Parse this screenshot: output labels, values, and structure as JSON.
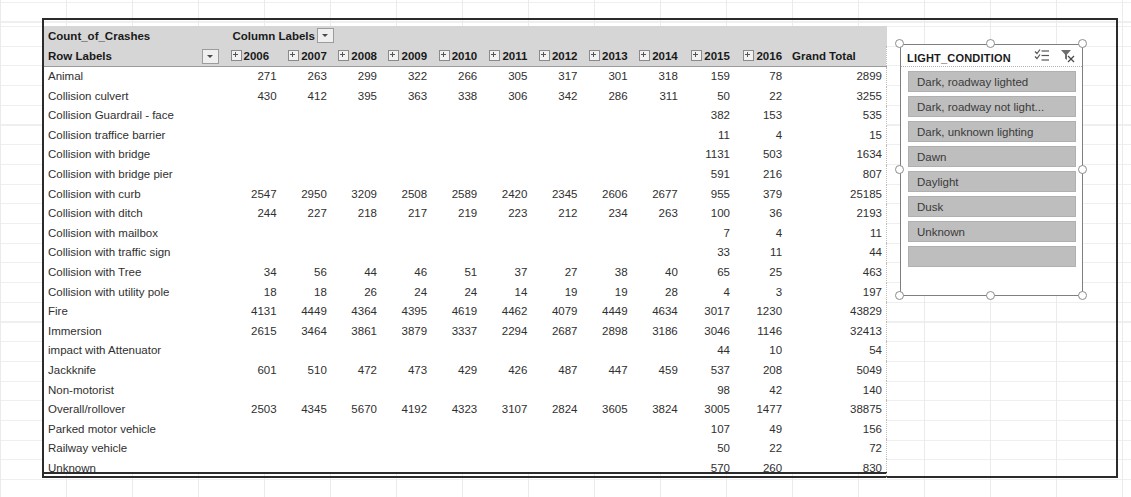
{
  "pivot": {
    "corner_label": "Count_of_Crashes",
    "column_labels_label": "Column Labels",
    "row_labels_label": "Row Labels",
    "grand_total_label": "Grand Total",
    "years": [
      "2006",
      "2007",
      "2008",
      "2009",
      "2010",
      "2011",
      "2012",
      "2013",
      "2014",
      "2015",
      "2016"
    ],
    "rows": [
      {
        "label": "Animal",
        "values": [
          "271",
          "263",
          "299",
          "322",
          "266",
          "305",
          "317",
          "301",
          "318",
          "159",
          "78"
        ],
        "total": "2899"
      },
      {
        "label": "Collision culvert",
        "values": [
          "430",
          "412",
          "395",
          "363",
          "338",
          "306",
          "342",
          "286",
          "311",
          "50",
          "22"
        ],
        "total": "3255"
      },
      {
        "label": "Collision Guardrail - face",
        "values": [
          "",
          "",
          "",
          "",
          "",
          "",
          "",
          "",
          "",
          "382",
          "153"
        ],
        "total": "535"
      },
      {
        "label": "Collision traffice barrier",
        "values": [
          "",
          "",
          "",
          "",
          "",
          "",
          "",
          "",
          "",
          "11",
          "4"
        ],
        "total": "15"
      },
      {
        "label": "Collision with bridge",
        "values": [
          "",
          "",
          "",
          "",
          "",
          "",
          "",
          "",
          "",
          "1131",
          "503"
        ],
        "total": "1634"
      },
      {
        "label": "Collision with bridge pier",
        "values": [
          "",
          "",
          "",
          "",
          "",
          "",
          "",
          "",
          "",
          "591",
          "216"
        ],
        "total": "807"
      },
      {
        "label": "Collision with curb",
        "values": [
          "2547",
          "2950",
          "3209",
          "2508",
          "2589",
          "2420",
          "2345",
          "2606",
          "2677",
          "955",
          "379"
        ],
        "total": "25185"
      },
      {
        "label": "Collision with ditch",
        "values": [
          "244",
          "227",
          "218",
          "217",
          "219",
          "223",
          "212",
          "234",
          "263",
          "100",
          "36"
        ],
        "total": "2193"
      },
      {
        "label": "Collision with mailbox",
        "values": [
          "",
          "",
          "",
          "",
          "",
          "",
          "",
          "",
          "",
          "7",
          "4"
        ],
        "total": "11"
      },
      {
        "label": "Collision with traffic sign",
        "values": [
          "",
          "",
          "",
          "",
          "",
          "",
          "",
          "",
          "",
          "33",
          "11"
        ],
        "total": "44"
      },
      {
        "label": "Collision with Tree",
        "values": [
          "34",
          "56",
          "44",
          "46",
          "51",
          "37",
          "27",
          "38",
          "40",
          "65",
          "25"
        ],
        "total": "463"
      },
      {
        "label": "Collision with utility pole",
        "values": [
          "18",
          "18",
          "26",
          "24",
          "24",
          "14",
          "19",
          "19",
          "28",
          "4",
          "3"
        ],
        "total": "197"
      },
      {
        "label": "Fire",
        "values": [
          "4131",
          "4449",
          "4364",
          "4395",
          "4619",
          "4462",
          "4079",
          "4449",
          "4634",
          "3017",
          "1230"
        ],
        "total": "43829"
      },
      {
        "label": "Immersion",
        "values": [
          "2615",
          "3464",
          "3861",
          "3879",
          "3337",
          "2294",
          "2687",
          "2898",
          "3186",
          "3046",
          "1146"
        ],
        "total": "32413"
      },
      {
        "label": "impact with Attenuator",
        "values": [
          "",
          "",
          "",
          "",
          "",
          "",
          "",
          "",
          "",
          "44",
          "10"
        ],
        "total": "54"
      },
      {
        "label": "Jackknife",
        "values": [
          "601",
          "510",
          "472",
          "473",
          "429",
          "426",
          "487",
          "447",
          "459",
          "537",
          "208"
        ],
        "total": "5049"
      },
      {
        "label": "Non-motorist",
        "values": [
          "",
          "",
          "",
          "",
          "",
          "",
          "",
          "",
          "",
          "98",
          "42"
        ],
        "total": "140"
      },
      {
        "label": "Overall/rollover",
        "values": [
          "2503",
          "4345",
          "5670",
          "4192",
          "4323",
          "3107",
          "2824",
          "3605",
          "3824",
          "3005",
          "1477"
        ],
        "total": "38875"
      },
      {
        "label": "Parked motor vehicle",
        "values": [
          "",
          "",
          "",
          "",
          "",
          "",
          "",
          "",
          "",
          "107",
          "49"
        ],
        "total": "156"
      },
      {
        "label": "Railway vehicle",
        "values": [
          "",
          "",
          "",
          "",
          "",
          "",
          "",
          "",
          "",
          "50",
          "22"
        ],
        "total": "72"
      },
      {
        "label": "Unknown",
        "values": [
          "",
          "",
          "",
          "",
          "",
          "",
          "",
          "",
          "",
          "570",
          "260"
        ],
        "total": "830"
      }
    ]
  },
  "slicer": {
    "title": "LIGHT_CONDITION",
    "multiselect_icon": "multi-select-icon",
    "clear_filter_icon": "clear-filter-icon",
    "items": [
      "Dark, roadway lighted",
      "Dark, roadway not light...",
      "Dark, unknown lighting",
      "Dawn",
      "Daylight",
      "Dusk",
      "Unknown",
      ""
    ]
  },
  "colors": {
    "header_band": "#d6d6d6",
    "slicer_item": "#bebebe",
    "frame_border": "#2b2b2b"
  }
}
